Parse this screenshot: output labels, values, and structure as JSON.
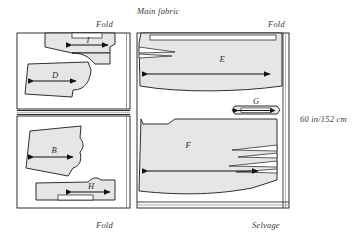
{
  "diagram": {
    "title": "Main fabric",
    "dimension_label": "60 in/152 cm",
    "edge_labels": {
      "top_left_fold": "Fold",
      "top_right_fold": "Fold",
      "bottom_left_fold": "Fold",
      "bottom_right_selvage": "Selvage"
    },
    "fabric_fill": "#ffffff",
    "piece_fill": "#e6e6e6",
    "line_color": "#1a1a1a",
    "text_color": "#3a3a3a"
  },
  "panels": [
    {
      "name": "left-panel-upper",
      "pieces": [
        {
          "letter": "I",
          "name": "piece-i"
        },
        {
          "letter": "D",
          "name": "piece-d"
        }
      ]
    },
    {
      "name": "left-panel-lower",
      "pieces": [
        {
          "letter": "B",
          "name": "piece-b"
        },
        {
          "letter": "H",
          "name": "piece-h"
        }
      ]
    },
    {
      "name": "right-panel",
      "pieces": [
        {
          "letter": "E",
          "name": "piece-e"
        },
        {
          "letter": "G",
          "name": "piece-g"
        },
        {
          "letter": "F",
          "name": "piece-f"
        }
      ]
    }
  ],
  "pieces_index": {
    "I": "I",
    "D": "D",
    "B": "B",
    "H": "H",
    "E": "E",
    "G": "G",
    "F": "F"
  }
}
